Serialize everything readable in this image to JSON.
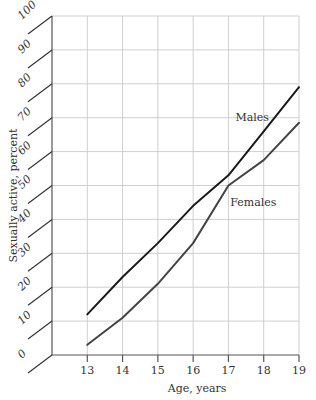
{
  "chart_data": {
    "type": "line",
    "title": "",
    "xlabel": "Age, years",
    "ylabel": "Sexually active, percent",
    "x": [
      13,
      14,
      15,
      16,
      17,
      18,
      19
    ],
    "xlim": [
      12,
      19
    ],
    "ylim": [
      0,
      100
    ],
    "yticks": [
      0,
      10,
      20,
      30,
      40,
      50,
      60,
      70,
      80,
      90,
      100
    ],
    "xticks": [
      13,
      14,
      15,
      16,
      17,
      18,
      19
    ],
    "grid": true,
    "series": [
      {
        "name": "Males",
        "color": "#1a1a1a",
        "values": [
          12,
          23,
          33,
          44,
          53,
          66,
          79
        ],
        "label_anchor": {
          "x": 17.2,
          "y": 69
        }
      },
      {
        "name": "Females",
        "color": "#444444",
        "values": [
          3,
          11,
          21,
          33,
          50,
          57.5,
          68.5
        ],
        "label_anchor": {
          "x": 17.05,
          "y": 44
        }
      }
    ]
  }
}
